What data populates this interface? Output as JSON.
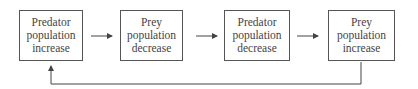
{
  "diagram": {
    "nodes": [
      {
        "id": "n1",
        "label": "Predator\npopulation\nincrease"
      },
      {
        "id": "n2",
        "label": "Prey\npopulation\ndecrease"
      },
      {
        "id": "n3",
        "label": "Predator\npopulation\ndecrease"
      },
      {
        "id": "n4",
        "label": "Prey\npopulation\nincrease"
      }
    ],
    "edges": [
      {
        "from": "n1",
        "to": "n2"
      },
      {
        "from": "n2",
        "to": "n3"
      },
      {
        "from": "n3",
        "to": "n4"
      },
      {
        "from": "n4",
        "to": "n1",
        "type": "feedback-loop"
      }
    ]
  }
}
